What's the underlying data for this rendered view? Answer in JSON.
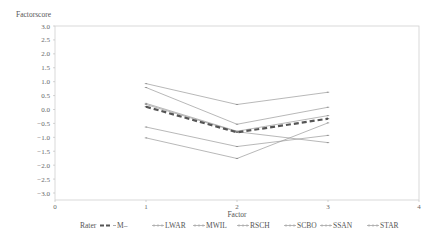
{
  "chart_data": {
    "type": "line",
    "title": "",
    "ylabel": "Factorscore",
    "xlabel": "Factor",
    "x": [
      1,
      2,
      3
    ],
    "xlim": [
      0,
      4
    ],
    "ylim": [
      -3.0,
      3.0
    ],
    "x_ticks": [
      "0",
      "1",
      "2",
      "3",
      "4"
    ],
    "y_ticks": [
      "3.0",
      "2.5",
      "2.0",
      "1.5",
      "1.0",
      "0.5",
      "0.0",
      "-0.5",
      "-1.0",
      "-1.5",
      "-2.0",
      "-2.5",
      "-3.0"
    ],
    "grid": false,
    "legend_title": "Rater",
    "legend_position": "bottom",
    "series": [
      {
        "name": "M",
        "values": [
          0.1,
          -0.82,
          -0.33
        ],
        "style": "dashed-bold",
        "color": "#555555"
      },
      {
        "name": "LWAR",
        "values": [
          0.93,
          0.18,
          0.62
        ],
        "style": "solid",
        "color": "#888888"
      },
      {
        "name": "MWIL",
        "values": [
          0.79,
          -0.53,
          0.08
        ],
        "style": "solid",
        "color": "#888888"
      },
      {
        "name": "RSCH",
        "values": [
          0.22,
          -0.78,
          -0.22
        ],
        "style": "solid",
        "color": "#888888"
      },
      {
        "name": "SCBO",
        "values": [
          0.18,
          -0.8,
          -1.19
        ],
        "style": "solid",
        "color": "#888888"
      },
      {
        "name": "SSAN",
        "values": [
          -0.63,
          -1.33,
          -0.93
        ],
        "style": "solid",
        "color": "#888888"
      },
      {
        "name": "STAR",
        "values": [
          -1.02,
          -1.76,
          -0.48
        ],
        "style": "solid",
        "color": "#888888"
      }
    ]
  },
  "labels": {
    "y_axis_title": "Factorscore",
    "x_axis_title": "Factor",
    "legend_title": "Rater"
  },
  "legend": [
    {
      "label": "M",
      "symbol": "▬▪–",
      "x": 100
    },
    {
      "label": "LWAR",
      "symbol": "+++",
      "x": 152
    },
    {
      "label": "MWIL",
      "symbol": "+++",
      "x": 193
    },
    {
      "label": "RSCH",
      "symbol": "+++",
      "x": 237
    },
    {
      "label": "SCBO",
      "symbol": "+++",
      "x": 284
    },
    {
      "label": "SSAN",
      "symbol": "+++",
      "x": 320
    },
    {
      "label": "STAR",
      "symbol": "+++",
      "x": 367
    }
  ]
}
